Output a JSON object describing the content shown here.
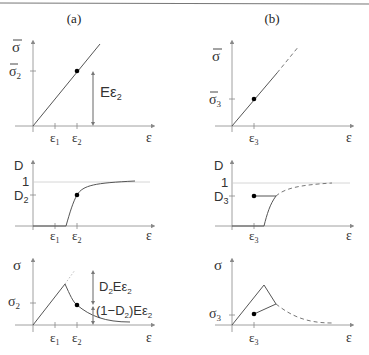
{
  "panels": {
    "a": {
      "title": "(a)"
    },
    "b": {
      "title": "(b)"
    }
  },
  "labels": {
    "sigma_bar": "σ",
    "sigma_bar_2": "σ",
    "sigma_bar_2_sub": "2",
    "sigma_bar_3": "σ",
    "sigma_bar_3_sub": "3",
    "E_eps2": "Eε",
    "E_eps2_sub": "2",
    "eps": "ε",
    "eps1": "ε",
    "eps1_sub": "1",
    "eps2": "ε",
    "eps2_sub": "2",
    "eps3": "ε",
    "eps3_sub": "3",
    "D": "D",
    "one": "1",
    "D2": "D",
    "D2_sub": "2",
    "D3": "D",
    "D3_sub": "3",
    "sigma": "σ",
    "sigma2": "σ",
    "sigma2_sub": "2",
    "sigma3": "σ",
    "sigma3_sub": "3",
    "D2E_eps2_a": "D",
    "D2E_eps2_sub": "2",
    "D2E_eps2_b": "Eε",
    "D2E_eps2_sub2": "2",
    "one_minus_a": "(1−D",
    "one_minus_sub": "2",
    "one_minus_b": ")Eε",
    "one_minus_sub2": "2"
  },
  "colors": {
    "line": "#555555",
    "axis": "#888888",
    "guide": "#cccccc",
    "point": "#000000",
    "rule": "#777777"
  }
}
